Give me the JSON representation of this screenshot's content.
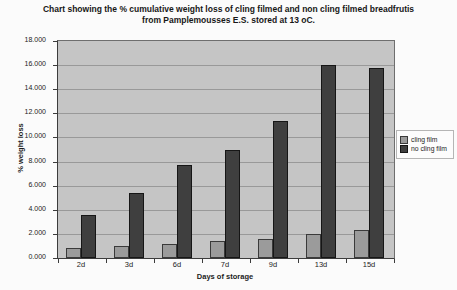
{
  "title": {
    "line1": "Chart showing the % cumulative weight loss of cling filmed and non cling filmed breadfrutis",
    "line2": "from Pamplemousses E.S. stored at 13 oC."
  },
  "chart_data": {
    "type": "bar",
    "categories": [
      "2d",
      "3d",
      "6d",
      "7d",
      "9d",
      "13d",
      "15d"
    ],
    "series": [
      {
        "name": "cling film",
        "color": "#9b9b9b",
        "border_color": "#3a3a3a",
        "values": [
          0.8,
          1.0,
          1.2,
          1.4,
          1.6,
          2.0,
          2.3
        ]
      },
      {
        "name": "no cling film",
        "color": "#3f3f3f",
        "border_color": "#161616",
        "values": [
          3.6,
          5.4,
          7.7,
          9.0,
          11.4,
          16.0,
          15.8
        ]
      }
    ],
    "xlabel": "Days of storage",
    "ylabel": "% weight loss",
    "ylim": [
      0,
      18
    ],
    "ytick_step": 2,
    "ytick_labels": [
      "0.000",
      "2.000",
      "4.000",
      "6.000",
      "8.000",
      "10.000",
      "12.000",
      "14.000",
      "16.000",
      "18.000"
    ],
    "grid": true,
    "legend_position": "right",
    "plot_bg": "#c5c5c5",
    "gridline_color": "#999999"
  }
}
